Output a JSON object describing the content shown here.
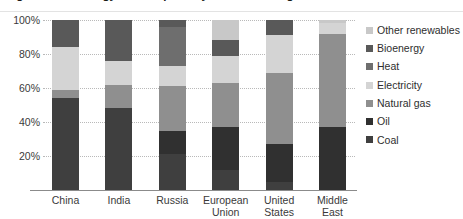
{
  "title": "Figure: Final energy consumption by source and region",
  "chart_data": {
    "type": "bar",
    "subtype": "stacked-bar-100-percent",
    "title": "Figure: Final energy consumption by source and region",
    "xlabel": "",
    "ylabel": "",
    "ylim": [
      0,
      100
    ],
    "ytick_labels": [
      "20%",
      "40%",
      "60%",
      "80%",
      "100%"
    ],
    "ytick_values": [
      20,
      40,
      60,
      80,
      100
    ],
    "grid": true,
    "legend_position": "right",
    "categories": [
      "China",
      "India",
      "Russia",
      "European\nUnion",
      "United\nStates",
      "Middle\nEast"
    ],
    "series": [
      {
        "name": "Coal",
        "color": "#3f3f3f",
        "values": [
          54,
          48,
          21,
          12,
          5,
          0
        ]
      },
      {
        "name": "Oil",
        "color": "#303030",
        "values": [
          0,
          0,
          14,
          25,
          22,
          37
        ]
      },
      {
        "name": "Natural gas",
        "color": "#8f8f8f",
        "values": [
          5,
          14,
          26,
          26,
          42,
          55
        ]
      },
      {
        "name": "Electricity",
        "color": "#d4d4d4",
        "values": [
          25,
          14,
          12,
          16,
          22,
          6
        ]
      },
      {
        "name": "Heat",
        "color": "#6e6e6e",
        "values": [
          0,
          0,
          23,
          0,
          0,
          0
        ]
      },
      {
        "name": "Bioenergy",
        "color": "#595959",
        "values": [
          16,
          24,
          4,
          9,
          9,
          0
        ]
      },
      {
        "name": "Other renewables",
        "color": "#c8c8c8",
        "values": [
          0,
          0,
          0,
          12,
          0,
          2
        ]
      }
    ]
  },
  "legend": {
    "entries": [
      {
        "label": "Other renewables",
        "color": "#c8c8c8"
      },
      {
        "label": "Bioenergy",
        "color": "#595959"
      },
      {
        "label": "Heat",
        "color": "#6e6e6e"
      },
      {
        "label": "Electricity",
        "color": "#d4d4d4"
      },
      {
        "label": "Natural gas",
        "color": "#8f8f8f"
      },
      {
        "label": "Oil",
        "color": "#303030"
      },
      {
        "label": "Coal",
        "color": "#3f3f3f"
      }
    ]
  }
}
